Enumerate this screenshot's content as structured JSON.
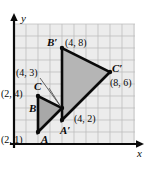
{
  "figure": {
    "kind": "coordinate-grid-dilation-diagram",
    "axes": {
      "x_label": "x",
      "y_label": "y",
      "grid_visible": true,
      "x_range": [
        0,
        10
      ],
      "y_range": [
        0,
        10
      ],
      "unit_px": 12,
      "origin_px": [
        14,
        144
      ]
    },
    "colors": {
      "ink": "#0a0a0a",
      "grid_line": "#b9b9b9",
      "grid_fill": "#ececec",
      "preimage_fill": "#a8a8a8",
      "image_fill": "#b5b5b5",
      "leader_line": "#555555",
      "background": "#ffffff"
    },
    "preimage": {
      "name": "triangle-ABC",
      "vertices": [
        {
          "label": "A",
          "coord_text": "(2, 1)",
          "x": 2,
          "y": 1
        },
        {
          "label": "B",
          "coord_text": "(2, 4)",
          "x": 2,
          "y": 4
        },
        {
          "label": "C",
          "coord_text": "(4, 3)",
          "x": 4,
          "y": 3
        }
      ]
    },
    "image": {
      "name": "triangle-A-prime-B-prime-C-prime",
      "vertices": [
        {
          "label": "A′",
          "coord_text": "(4, 2)",
          "x": 4,
          "y": 2
        },
        {
          "label": "B′",
          "coord_text": "(4, 8)",
          "x": 4,
          "y": 8
        },
        {
          "label": "C′",
          "coord_text": "(8, 6)",
          "x": 8,
          "y": 6
        }
      ]
    }
  }
}
